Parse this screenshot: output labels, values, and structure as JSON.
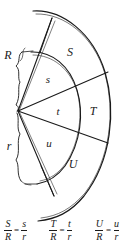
{
  "figure": {
    "type": "geometry-diagram",
    "center_vertex_label": "",
    "radii": [
      {
        "name": "outer-radius",
        "label": "R"
      },
      {
        "name": "inner-radius",
        "label": "r"
      }
    ],
    "outer_arc_labels": [
      {
        "name": "arc-S",
        "label": "S"
      },
      {
        "name": "arc-T",
        "label": "T"
      },
      {
        "name": "arc-U",
        "label": "U"
      }
    ],
    "inner_arc_labels": [
      {
        "name": "arc-s",
        "label": "s"
      },
      {
        "name": "arc-t",
        "label": "t"
      },
      {
        "name": "arc-u",
        "label": "u"
      }
    ],
    "line_color": "#1a1a1a",
    "background_color": "#ffffff"
  },
  "formulas": [
    {
      "name": "ratio-S-R",
      "left_numerator": "S",
      "left_denominator": "R",
      "equals": "=",
      "right_numerator": "s",
      "right_denominator": "r"
    },
    {
      "name": "ratio-T-R",
      "left_numerator": "T",
      "left_denominator": "R",
      "equals": "=",
      "right_numerator": "t",
      "right_denominator": "r"
    },
    {
      "name": "ratio-U-R",
      "left_numerator": "U",
      "left_denominator": "R",
      "equals": "=",
      "right_numerator": "u",
      "right_denominator": "r"
    }
  ]
}
